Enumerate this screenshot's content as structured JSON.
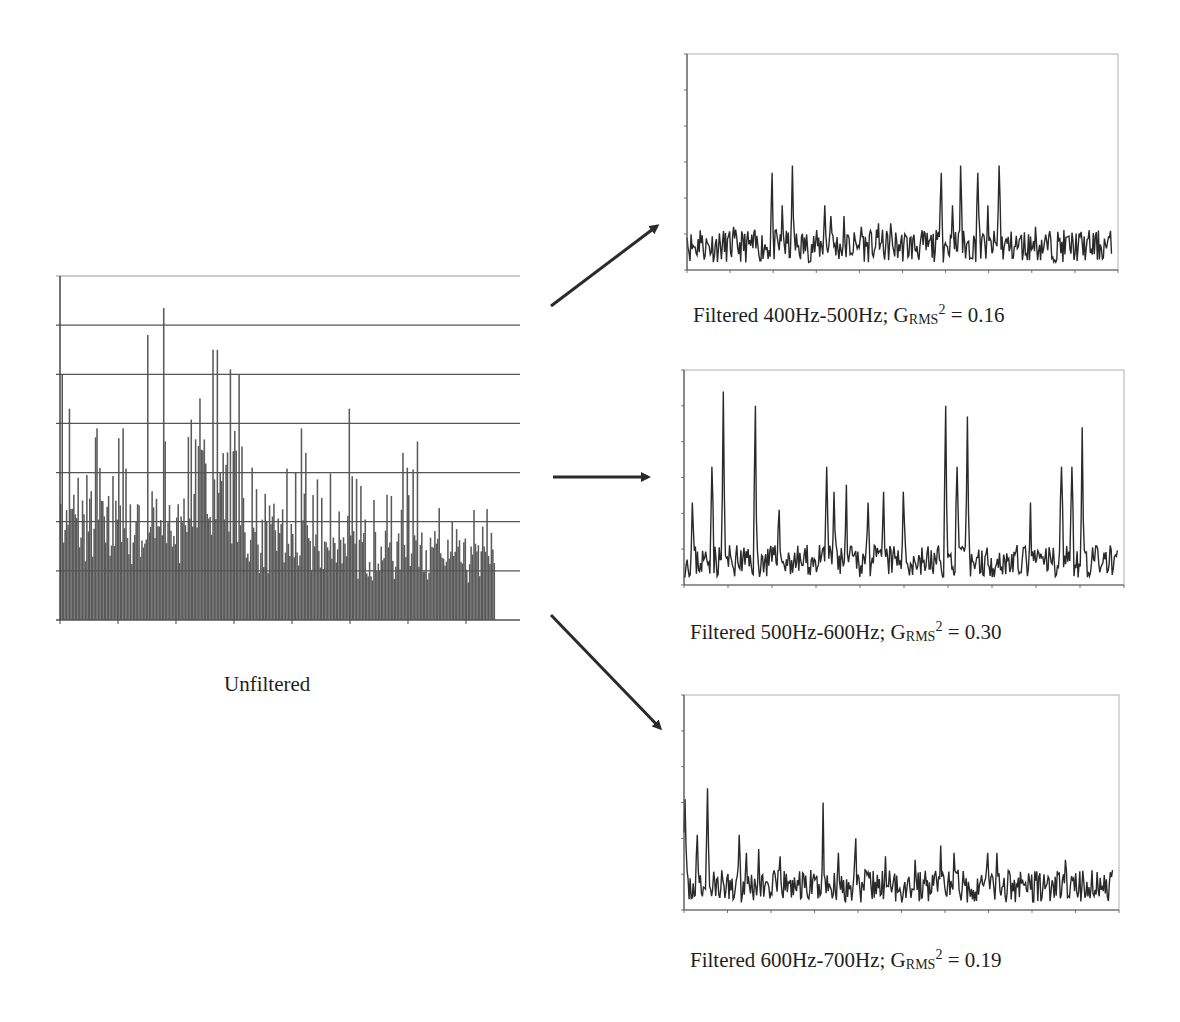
{
  "figure": {
    "unfiltered_label": "Unfiltered",
    "arrow_color": "#2a2a2a",
    "bar_color": "#5a5a5a",
    "line_color": "#2a2a2a",
    "grid_color": "#555555",
    "frame_color": "#b0b0b0"
  },
  "captions": [
    {
      "prefix": "Filtered 400Hz-500Hz; G",
      "sub": "RMS",
      "sup": "2",
      "suffix": " = 0.16"
    },
    {
      "prefix": "Filtered 500Hz-600Hz; G",
      "sub": "RMS",
      "sup": "2",
      "suffix": " = 0.30"
    },
    {
      "prefix": "Filtered 600Hz-700Hz; G",
      "sub": "RMS",
      "sup": "2",
      "suffix": " = 0.19"
    }
  ],
  "chart_data": [
    {
      "type": "bar",
      "title": "Unfiltered",
      "xlabel": "",
      "ylabel": "",
      "grid": true,
      "y_ticks": 7,
      "x_ticks": 8,
      "ylim": [
        0,
        7
      ],
      "description": "Dense unfiltered spectrum; background level ~1-1.5 units with spikes up to ~6.4 units (max near 20% of x-range)",
      "peaks": [
        {
          "x": 0.005,
          "y": 5.0
        },
        {
          "x": 0.02,
          "y": 4.3
        },
        {
          "x": 0.085,
          "y": 3.9
        },
        {
          "x": 0.135,
          "y": 3.7
        },
        {
          "x": 0.145,
          "y": 3.9
        },
        {
          "x": 0.2,
          "y": 5.8
        },
        {
          "x": 0.237,
          "y": 6.35
        },
        {
          "x": 0.35,
          "y": 5.5
        },
        {
          "x": 0.36,
          "y": 5.5
        },
        {
          "x": 0.39,
          "y": 5.1
        },
        {
          "x": 0.41,
          "y": 5.0
        },
        {
          "x": 0.44,
          "y": 3.1
        },
        {
          "x": 0.555,
          "y": 3.9
        },
        {
          "x": 0.565,
          "y": 3.4
        },
        {
          "x": 0.665,
          "y": 4.3
        },
        {
          "x": 0.79,
          "y": 3.4
        },
        {
          "x": 0.8,
          "y": 3.1
        }
      ]
    },
    {
      "type": "line",
      "title": "Filtered 400Hz-500Hz; GRMS^2 = 0.16",
      "grid": false,
      "y_ticks": 6,
      "ylim": [
        0,
        6
      ],
      "peaks": [
        {
          "x": 0.0,
          "y": 0.9
        },
        {
          "x": 0.03,
          "y": 1.1
        },
        {
          "x": 0.11,
          "y": 1.2
        },
        {
          "x": 0.2,
          "y": 2.7
        },
        {
          "x": 0.225,
          "y": 1.8
        },
        {
          "x": 0.248,
          "y": 2.9
        },
        {
          "x": 0.325,
          "y": 1.8
        },
        {
          "x": 0.34,
          "y": 1.5
        },
        {
          "x": 0.37,
          "y": 1.5
        },
        {
          "x": 0.41,
          "y": 1.2
        },
        {
          "x": 0.45,
          "y": 1.3
        },
        {
          "x": 0.48,
          "y": 1.3
        },
        {
          "x": 0.6,
          "y": 2.7
        },
        {
          "x": 0.625,
          "y": 1.8
        },
        {
          "x": 0.645,
          "y": 2.9
        },
        {
          "x": 0.685,
          "y": 2.7
        },
        {
          "x": 0.71,
          "y": 1.8
        },
        {
          "x": 0.735,
          "y": 2.9
        },
        {
          "x": 0.82,
          "y": 1.2
        }
      ]
    },
    {
      "type": "line",
      "title": "Filtered 500Hz-600Hz; GRMS^2 = 0.30",
      "grid": false,
      "y_ticks": 6,
      "ylim": [
        0,
        6
      ],
      "peaks": [
        {
          "x": 0.02,
          "y": 2.3
        },
        {
          "x": 0.065,
          "y": 3.3
        },
        {
          "x": 0.09,
          "y": 5.4
        },
        {
          "x": 0.165,
          "y": 5.0
        },
        {
          "x": 0.22,
          "y": 2.1
        },
        {
          "x": 0.33,
          "y": 3.3
        },
        {
          "x": 0.345,
          "y": 2.6
        },
        {
          "x": 0.375,
          "y": 2.8
        },
        {
          "x": 0.425,
          "y": 2.3
        },
        {
          "x": 0.46,
          "y": 2.6
        },
        {
          "x": 0.505,
          "y": 2.6
        },
        {
          "x": 0.605,
          "y": 5.0
        },
        {
          "x": 0.63,
          "y": 3.3
        },
        {
          "x": 0.655,
          "y": 4.7
        },
        {
          "x": 0.8,
          "y": 2.3
        },
        {
          "x": 0.87,
          "y": 3.3
        },
        {
          "x": 0.895,
          "y": 3.3
        },
        {
          "x": 0.92,
          "y": 4.4
        }
      ]
    },
    {
      "type": "line",
      "title": "Filtered 600Hz-700Hz; GRMS^2 = 0.19",
      "grid": false,
      "y_ticks": 6,
      "ylim": [
        0,
        6
      ],
      "peaks": [
        {
          "x": 0.002,
          "y": 3.1
        },
        {
          "x": 0.03,
          "y": 2.1
        },
        {
          "x": 0.055,
          "y": 3.4
        },
        {
          "x": 0.13,
          "y": 2.1
        },
        {
          "x": 0.145,
          "y": 1.6
        },
        {
          "x": 0.175,
          "y": 1.7
        },
        {
          "x": 0.225,
          "y": 1.5
        },
        {
          "x": 0.325,
          "y": 3.0
        },
        {
          "x": 0.36,
          "y": 1.6
        },
        {
          "x": 0.4,
          "y": 2.0
        },
        {
          "x": 0.47,
          "y": 1.5
        },
        {
          "x": 0.54,
          "y": 1.4
        },
        {
          "x": 0.6,
          "y": 1.8
        },
        {
          "x": 0.63,
          "y": 1.6
        },
        {
          "x": 0.71,
          "y": 1.6
        },
        {
          "x": 0.73,
          "y": 1.6
        },
        {
          "x": 0.89,
          "y": 1.4
        }
      ]
    }
  ]
}
